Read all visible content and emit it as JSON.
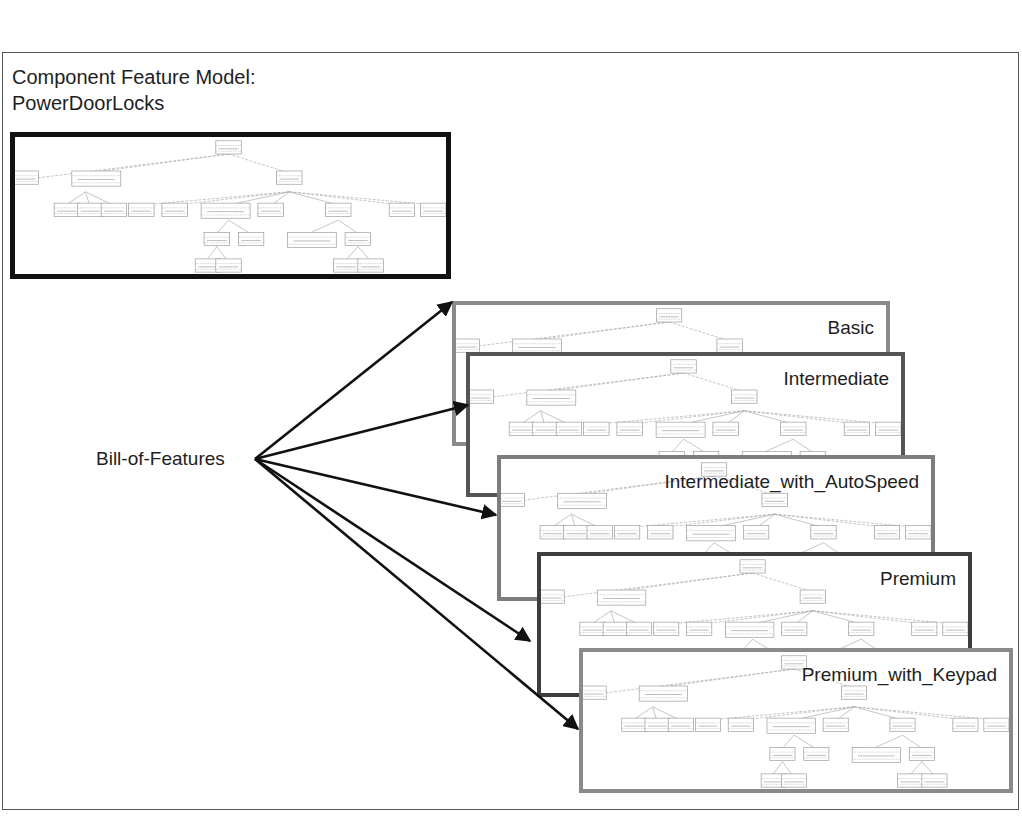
{
  "title": {
    "line1": "Component Feature Model:",
    "line2": "PowerDoorLocks"
  },
  "source_label": "Bill-of-Features",
  "component_model": {
    "name": "PowerDoorLocks",
    "border_color": "#111111"
  },
  "variants": [
    {
      "label": "Basic",
      "border_color": "#8a8a8a"
    },
    {
      "label": "Intermediate",
      "border_color": "#555555"
    },
    {
      "label": "Intermediate_with_AutoSpeed",
      "border_color": "#7d7d7d"
    },
    {
      "label": "Premium",
      "border_color": "#3e3e3e"
    },
    {
      "label": "Premium_with_Keypad",
      "border_color": "#8a8a8a"
    }
  ],
  "arrows": {
    "origin": [
      255,
      459
    ],
    "targets": [
      {
        "variant": "Basic",
        "tip": [
          452,
          302
        ]
      },
      {
        "variant": "Intermediate",
        "tip": [
          468,
          405
        ]
      },
      {
        "variant": "Intermediate_with_AutoSpeed",
        "tip": [
          496,
          515
        ]
      },
      {
        "variant": "Premium",
        "tip": [
          530,
          641
        ]
      },
      {
        "variant": "Premium_with_Keypad",
        "tip": [
          578,
          729
        ]
      }
    ]
  },
  "icons": {
    "arrow": "arrowhead-filled",
    "tree_thumbnail": "feature-tree-thumbnail"
  }
}
